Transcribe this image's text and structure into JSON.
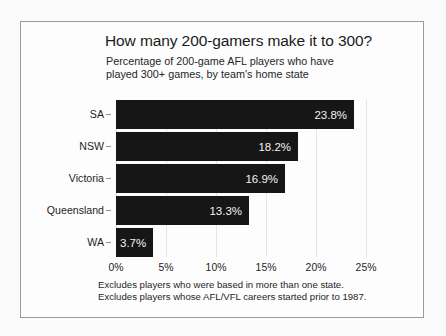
{
  "chart_data": {
    "type": "bar",
    "orientation": "horizontal",
    "title": "How many 200-gamers make it to 300?",
    "subtitle_lines": [
      "Percentage of 200-game AFL players who have",
      "played 300+ games, by team's home state"
    ],
    "categories": [
      "SA",
      "NSW",
      "Victoria",
      "Queensland",
      "WA"
    ],
    "values": [
      23.8,
      18.2,
      16.9,
      13.3,
      3.7
    ],
    "value_labels": [
      "23.8%",
      "18.2%",
      "16.9%",
      "13.3%",
      "3.7%"
    ],
    "xlabel": "",
    "ylabel": "",
    "xlim": [
      0,
      25.5
    ],
    "xticks": [
      0,
      5,
      10,
      15,
      20,
      25
    ],
    "xtick_labels": [
      "0%",
      "5%",
      "10%",
      "15%",
      "20%",
      "25%"
    ],
    "grid": true,
    "legend": false,
    "bar_color": "#161616",
    "value_label_color": "#f2f2f2",
    "footnotes": [
      "Excludes players who were based in more than one state.",
      "Excludes players whose AFL/VFL careers started prior to 1987."
    ]
  }
}
